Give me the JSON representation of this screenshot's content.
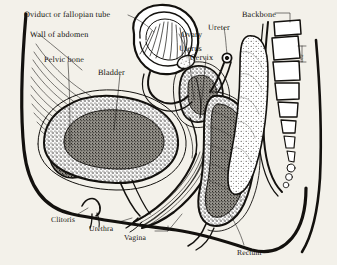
{
  "figure": {
    "background_color": "#f3f1ea",
    "ink_color": "#13110e"
  },
  "labels": [
    {
      "id": "oviduct",
      "text": "Oviduct or fallopian tube",
      "x": 24,
      "y": 11
    },
    {
      "id": "wall_abdomen",
      "text": "Wall of abdomen",
      "x": 30,
      "y": 31
    },
    {
      "id": "pelvic_bone",
      "text": "Pelvic bone",
      "x": 44,
      "y": 56
    },
    {
      "id": "bladder",
      "text": "Bladder",
      "x": 98,
      "y": 69
    },
    {
      "id": "ovary",
      "text": "Ovary",
      "x": 181,
      "y": 31
    },
    {
      "id": "uterus",
      "text": "Uterus",
      "x": 179,
      "y": 45
    },
    {
      "id": "cervix",
      "text": "Cervix",
      "x": 190,
      "y": 54
    },
    {
      "id": "ureter",
      "text": "Ureter",
      "x": 208,
      "y": 24
    },
    {
      "id": "backbone",
      "text": "Backbone",
      "x": 242,
      "y": 11
    },
    {
      "id": "clitoris",
      "text": "Clitoris",
      "x": 51,
      "y": 216
    },
    {
      "id": "urethra",
      "text": "Urethra",
      "x": 89,
      "y": 225
    },
    {
      "id": "vagina",
      "text": "Vagina",
      "x": 124,
      "y": 234
    },
    {
      "id": "rectum",
      "text": "Rectum",
      "x": 237,
      "y": 249
    },
    {
      "id": "disc",
      "text": "Disc",
      "x": 300,
      "y": 53
    }
  ],
  "structures": [
    {
      "id": "body-outline",
      "name": "body outline"
    },
    {
      "id": "abdominal-wall",
      "name": "wall of abdomen muscle fibers"
    },
    {
      "id": "pelvic-bone",
      "name": "pelvic bone (pubis), stippled"
    },
    {
      "id": "bladder",
      "name": "urinary bladder, stippled"
    },
    {
      "id": "uterus",
      "name": "uterus, stippled wedge"
    },
    {
      "id": "cervix",
      "name": "cervix"
    },
    {
      "id": "ovary",
      "name": "ovary"
    },
    {
      "id": "fallopian-tube",
      "name": "oviduct with fimbriae, coiled"
    },
    {
      "id": "ureter",
      "name": "ureter tube"
    },
    {
      "id": "vagina",
      "name": "vaginal canal"
    },
    {
      "id": "urethra",
      "name": "urethra"
    },
    {
      "id": "clitoris",
      "name": "clitoris"
    },
    {
      "id": "rectum",
      "name": "rectum, stippled"
    },
    {
      "id": "backbone",
      "name": "vertebral column, 9 vertebrae"
    },
    {
      "id": "sacrum",
      "name": "sacrum and coccyx"
    }
  ]
}
